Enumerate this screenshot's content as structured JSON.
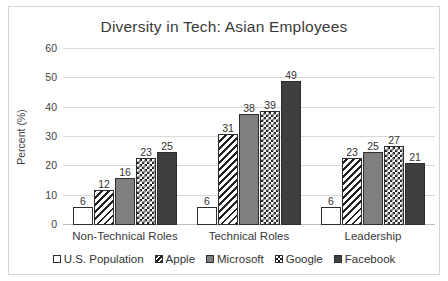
{
  "chart_data": {
    "type": "bar",
    "title": "Diversity in Tech: Asian Employees",
    "xlabel": "",
    "ylabel": "Percent (%)",
    "ylim": [
      0,
      60
    ],
    "yticks": [
      0,
      10,
      20,
      30,
      40,
      50,
      60
    ],
    "grid": true,
    "legend_position": "bottom",
    "categories": [
      "Non-Technical Roles",
      "Technical Roles",
      "Leadership"
    ],
    "series": [
      {
        "name": "U.S. Population",
        "values": [
          6,
          6,
          6
        ],
        "pattern": "plain",
        "color": "#ffffff"
      },
      {
        "name": "Apple",
        "values": [
          12,
          31,
          23
        ],
        "pattern": "diagonal",
        "color": "#222222"
      },
      {
        "name": "Microsoft",
        "values": [
          16,
          38,
          25
        ],
        "pattern": "gray",
        "color": "#7f7f7f"
      },
      {
        "name": "Google",
        "values": [
          23,
          39,
          27
        ],
        "pattern": "checker",
        "color": "#1f1f1f"
      },
      {
        "name": "Facebook",
        "values": [
          25,
          49,
          21
        ],
        "pattern": "dark",
        "color": "#3f3f3f"
      }
    ],
    "data_labels": [
      [
        6,
        12,
        16,
        23,
        25
      ],
      [
        6,
        31,
        38,
        39,
        49
      ],
      [
        6,
        23,
        25,
        27,
        21
      ]
    ]
  },
  "legend": {
    "items": [
      {
        "label": "U.S. Population",
        "pattern": "plain"
      },
      {
        "label": "Apple",
        "pattern": "diagonal"
      },
      {
        "label": "Microsoft",
        "pattern": "gray"
      },
      {
        "label": "Google",
        "pattern": "checker"
      },
      {
        "label": "Facebook",
        "pattern": "dark"
      }
    ]
  }
}
